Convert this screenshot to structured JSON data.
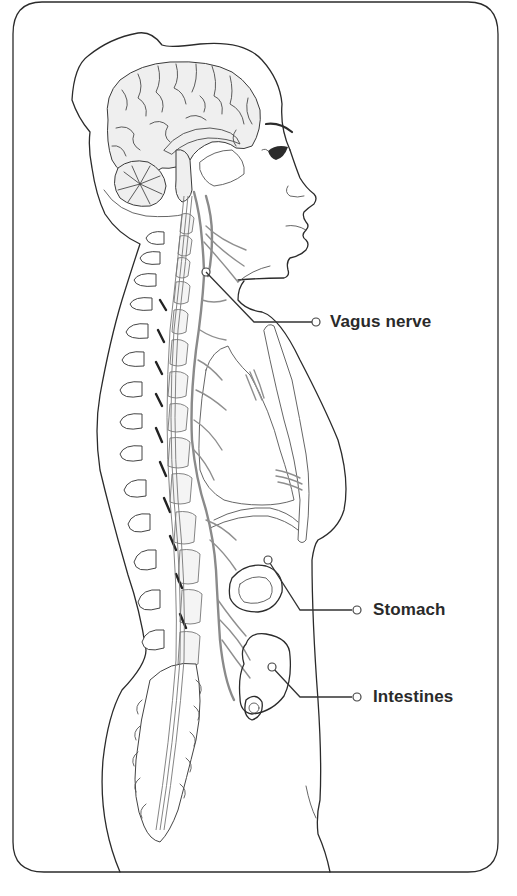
{
  "diagram": {
    "type": "anatomical-illustration",
    "colors": {
      "frame": "#2b2b2b",
      "outline": "#2b2b2b",
      "nerve": "#8a8a8a",
      "brain_fill": "#efefef",
      "label_text": "#2a2a2a",
      "background": "#ffffff"
    },
    "labels": [
      {
        "id": "vagus-nerve",
        "text": "Vagus nerve"
      },
      {
        "id": "stomach",
        "text": "Stomach"
      },
      {
        "id": "intestines",
        "text": "Intestines"
      }
    ]
  }
}
